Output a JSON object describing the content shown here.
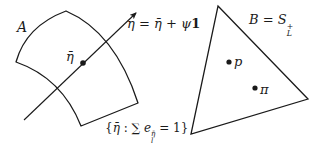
{
  "diagram": {
    "region_a": {
      "label": "A",
      "point_label": "η̄",
      "arrow_label": {
        "lhs": "η",
        "eq": " = ",
        "term1": "η̄",
        "plus": " + ",
        "psi": "ψ",
        "one": "1"
      },
      "constraint_label": {
        "open": "{",
        "var": "η̄",
        "colon": " : ",
        "sum": "∑ ",
        "e": "e",
        "sup": "η̄",
        "sub": "l",
        "eq": " = 1",
        "close": "}"
      }
    },
    "region_b": {
      "label_lhs": "B",
      "label_eq": " = ",
      "label_set": "S",
      "label_sup": "+",
      "label_sub": "L",
      "points": [
        {
          "name": "p",
          "label": "p"
        },
        {
          "name": "pi",
          "label": "π"
        }
      ]
    },
    "colors": {
      "stroke": "#1a1a1a",
      "background": "#ffffff"
    }
  }
}
